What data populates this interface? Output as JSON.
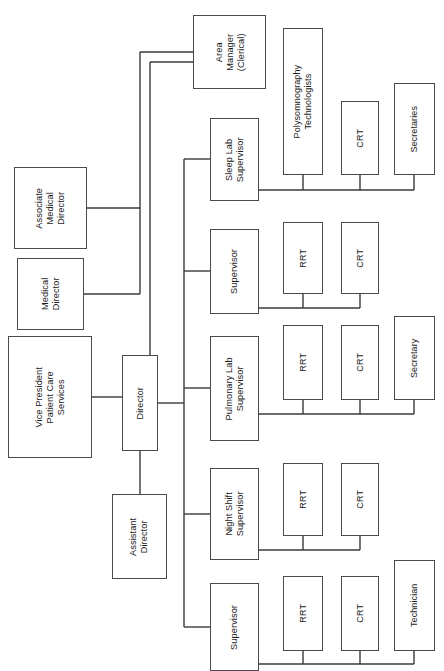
{
  "chart": {
    "orientation": "rotated-90-ccw",
    "canvas": {
      "width": 444,
      "height": 671
    },
    "style": {
      "box_border_color": "#4a4a4a",
      "box_fill_color": "#ffffff",
      "line_color": "#3a3a3a",
      "text_color": "#1a1a1a",
      "background": "#ffffff"
    },
    "nodes": [
      {
        "id": "area-manager-clerical",
        "label": "Area\nManager\n(Clerical)",
        "x": 193,
        "y": 15,
        "w": 73,
        "h": 74
      },
      {
        "id": "associate-medical-director",
        "label": "Associate\nMedical\nDirector",
        "x": 14,
        "y": 167,
        "w": 73,
        "h": 82
      },
      {
        "id": "medical-director",
        "label": "Medical\nDirector",
        "x": 17,
        "y": 258,
        "w": 67,
        "h": 72
      },
      {
        "id": "vice-president-patient-care-services",
        "label": "Vice President\nPatient Care\nServices",
        "x": 8,
        "y": 336,
        "w": 84,
        "h": 122
      },
      {
        "id": "director",
        "label": "Director",
        "x": 122,
        "y": 355,
        "w": 36,
        "h": 96
      },
      {
        "id": "assistant-director",
        "label": "Assistant\nDirector",
        "x": 112,
        "y": 494,
        "w": 55,
        "h": 85
      },
      {
        "id": "sleep-lab-supervisor",
        "label": "Sleep Lab\nSupervisor",
        "x": 210,
        "y": 118,
        "w": 49,
        "h": 83
      },
      {
        "id": "supervisor-respiratory",
        "label": "Supervisor",
        "x": 210,
        "y": 229,
        "w": 49,
        "h": 85
      },
      {
        "id": "pulmonary-lab-supervisor",
        "label": "Pulmonary Lab\nSupervisor",
        "x": 210,
        "y": 336,
        "w": 49,
        "h": 105
      },
      {
        "id": "night-shift-supervisor",
        "label": "Night Shift\nSupervisor",
        "x": 210,
        "y": 468,
        "w": 49,
        "h": 92
      },
      {
        "id": "supervisor-general",
        "label": "Supervisor",
        "x": 210,
        "y": 583,
        "w": 49,
        "h": 88
      },
      {
        "id": "polysomnography-technologists",
        "label": "Polysomnography\nTechnologists",
        "x": 283,
        "y": 28,
        "w": 40,
        "h": 147
      },
      {
        "id": "crt-sleep-lab",
        "label": "CRT",
        "x": 341,
        "y": 101,
        "w": 38,
        "h": 74
      },
      {
        "id": "secretaries",
        "label": "Secretaries",
        "x": 394,
        "y": 83,
        "w": 41,
        "h": 92
      },
      {
        "id": "rrt-supervisor-respiratory",
        "label": "RRT",
        "x": 283,
        "y": 222,
        "w": 40,
        "h": 72
      },
      {
        "id": "crt-supervisor-respiratory",
        "label": "CRT",
        "x": 341,
        "y": 222,
        "w": 38,
        "h": 72
      },
      {
        "id": "rrt-pulmonary-lab",
        "label": "RRT",
        "x": 283,
        "y": 325,
        "w": 40,
        "h": 75
      },
      {
        "id": "crt-pulmonary-lab",
        "label": "CRT",
        "x": 341,
        "y": 325,
        "w": 38,
        "h": 75
      },
      {
        "id": "secretary-pulmonary-lab",
        "label": "Secretary",
        "x": 394,
        "y": 316,
        "w": 41,
        "h": 84
      },
      {
        "id": "rrt-night-shift",
        "label": "RRT",
        "x": 283,
        "y": 463,
        "w": 40,
        "h": 73
      },
      {
        "id": "crt-night-shift",
        "label": "CRT",
        "x": 341,
        "y": 463,
        "w": 38,
        "h": 73
      },
      {
        "id": "rrt-supervisor-general",
        "label": "RRT",
        "x": 283,
        "y": 576,
        "w": 40,
        "h": 75
      },
      {
        "id": "crt-supervisor-general",
        "label": "CRT",
        "x": 341,
        "y": 576,
        "w": 38,
        "h": 75
      },
      {
        "id": "technician",
        "label": "Technician",
        "x": 394,
        "y": 560,
        "w": 41,
        "h": 91
      }
    ],
    "connectors": [
      {
        "id": "vp-to-director",
        "points": "92,397 122,397"
      },
      {
        "id": "medical-director-stub",
        "points": "84,294 140,294"
      },
      {
        "id": "associate-medical-director-stub",
        "points": "87,208 140,208"
      },
      {
        "id": "medical-trunk",
        "points": "140,208 140,294"
      },
      {
        "id": "medical-trunk-up",
        "points": "140,208 140,52"
      },
      {
        "id": "medical-trunk-to-area-manager",
        "points": "140,52 193,52"
      },
      {
        "id": "director-to-area-manager-trunk",
        "points": "150,355 150,62"
      },
      {
        "id": "director-area-manager-elbow",
        "points": "150,62 193,62"
      },
      {
        "id": "director-to-assistant-director",
        "points": "140,451 140,494"
      },
      {
        "id": "director-to-supervisors-stem",
        "points": "158,403 184,403"
      },
      {
        "id": "supervisors-trunk",
        "points": "184,159 184,627"
      },
      {
        "id": "trunk-to-sleep-lab",
        "points": "184,159 210,159"
      },
      {
        "id": "trunk-to-supervisor-respiratory",
        "points": "184,271 210,271"
      },
      {
        "id": "trunk-to-pulmonary-lab",
        "points": "184,388 210,388"
      },
      {
        "id": "trunk-to-night-shift",
        "points": "184,514 210,514"
      },
      {
        "id": "trunk-to-supervisor-general",
        "points": "184,627 210,627"
      },
      {
        "id": "sleep-lab-bus",
        "points": "259,190 414,190"
      },
      {
        "id": "sleep-lab-to-polysomnography",
        "points": "303,175 303,190"
      },
      {
        "id": "sleep-lab-to-crt",
        "points": "360,175 360,190"
      },
      {
        "id": "sleep-lab-to-secretaries",
        "points": "414,175 414,190"
      },
      {
        "id": "supervisor-respiratory-bus",
        "points": "259,308 360,308"
      },
      {
        "id": "supervisor-respiratory-to-rrt",
        "points": "303,294 303,308"
      },
      {
        "id": "supervisor-respiratory-to-crt",
        "points": "360,294 360,308"
      },
      {
        "id": "pulmonary-lab-bus",
        "points": "259,414 414,414"
      },
      {
        "id": "pulmonary-lab-to-rrt",
        "points": "303,400 303,414"
      },
      {
        "id": "pulmonary-lab-to-crt",
        "points": "360,400 360,414"
      },
      {
        "id": "pulmonary-lab-to-secretary",
        "points": "414,400 414,414"
      },
      {
        "id": "night-shift-bus",
        "points": "259,550 360,550"
      },
      {
        "id": "night-shift-to-rrt",
        "points": "303,536 303,550"
      },
      {
        "id": "night-shift-to-crt",
        "points": "360,536 360,550"
      },
      {
        "id": "supervisor-general-bus",
        "points": "259,664 414,664"
      },
      {
        "id": "supervisor-general-to-rrt",
        "points": "303,651 303,664"
      },
      {
        "id": "supervisor-general-to-crt",
        "points": "360,651 360,664"
      },
      {
        "id": "supervisor-general-to-technician",
        "points": "414,651 414,664"
      }
    ]
  }
}
